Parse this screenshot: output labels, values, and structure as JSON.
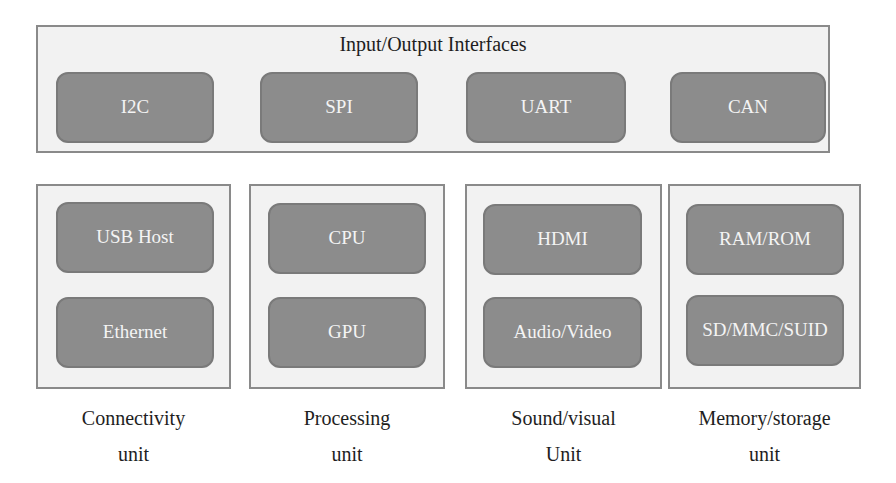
{
  "interfaces": {
    "title": "Input/Output Interfaces",
    "items": [
      "I2C",
      "SPI",
      "UART",
      "CAN"
    ]
  },
  "units": [
    {
      "label_line1": "Connectivity",
      "label_line2": "unit",
      "items": [
        "USB Host",
        "Ethernet"
      ]
    },
    {
      "label_line1": "Processing",
      "label_line2": "unit",
      "items": [
        "CPU",
        "GPU"
      ]
    },
    {
      "label_line1": "Sound/visual",
      "label_line2": "Unit",
      "items": [
        "HDMI",
        "Audio/Video"
      ]
    },
    {
      "label_line1": "Memory/storage",
      "label_line2": "unit",
      "items": [
        "RAM/ROM",
        "SD/MMC/SUID"
      ]
    }
  ],
  "colors": {
    "frame_bg": "#f2f2f2",
    "frame_border": "#8a8a8a",
    "chip_bg": "#8c8c8c",
    "chip_text": "#f4f4f4"
  }
}
